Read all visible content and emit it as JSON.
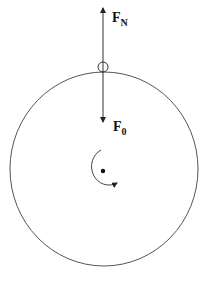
{
  "diagram": {
    "type": "free-body diagram of rotating wheel",
    "forces": [
      {
        "name": "F_N",
        "label_main": "F",
        "label_sub": "N",
        "direction": "up"
      },
      {
        "name": "F_0",
        "label_main": "F",
        "label_sub": "0",
        "direction": "down"
      }
    ],
    "contact_point": "small circle at top of wheel",
    "rotation": "clockwise arrow around center point",
    "colors": {
      "stroke": "#333333",
      "background": "#ffffff"
    }
  }
}
